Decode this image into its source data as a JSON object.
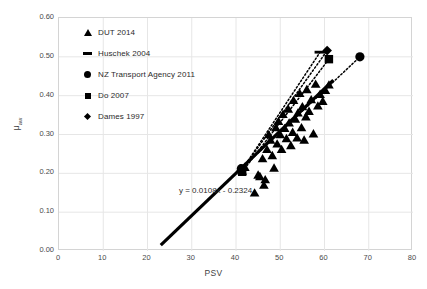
{
  "chart_data": {
    "type": "scatter",
    "title": "",
    "xlabel": "PSV",
    "ylabel": "μ",
    "ylabel_sub": "aw",
    "xlim": [
      0,
      80
    ],
    "ylim": [
      0.0,
      0.6
    ],
    "xticks": [
      0,
      10,
      20,
      30,
      40,
      50,
      60,
      70,
      80
    ],
    "yticks": [
      "0.00",
      "0.10",
      "0.20",
      "0.30",
      "0.40",
      "0.50",
      "0.60"
    ],
    "grid": true,
    "legend_position": "upper-left-inside",
    "annotations": [
      {
        "text": "y = 0.0108x - 0.2324",
        "x": 30,
        "y": 0.205
      }
    ],
    "legend": [
      {
        "label": "DUT 2014",
        "marker": "triangle-marker"
      },
      {
        "label": "Huschek 2004",
        "marker": "dash-marker"
      },
      {
        "label": "NZ Transport Agency 2011",
        "marker": "circle-marker"
      },
      {
        "label": "Do 2007",
        "marker": "square-marker"
      },
      {
        "label": "Dames 1997",
        "marker": "diamond-marker"
      }
    ],
    "series": [
      {
        "name": "DUT 2014",
        "marker": "triangle",
        "points": [
          [
            41.0,
            0.212
          ],
          [
            41.4,
            0.206
          ],
          [
            42.0,
            0.216
          ],
          [
            44.2,
            0.15
          ],
          [
            45.0,
            0.196
          ],
          [
            45.4,
            0.192
          ],
          [
            46.0,
            0.238
          ],
          [
            46.3,
            0.17
          ],
          [
            46.6,
            0.184
          ],
          [
            47.0,
            0.262
          ],
          [
            47.4,
            0.3
          ],
          [
            47.8,
            0.286
          ],
          [
            48.2,
            0.246
          ],
          [
            48.6,
            0.214
          ],
          [
            49.0,
            0.318
          ],
          [
            49.3,
            0.276
          ],
          [
            49.6,
            0.334
          ],
          [
            50.0,
            0.3
          ],
          [
            50.3,
            0.262
          ],
          [
            50.6,
            0.352
          ],
          [
            51.0,
            0.316
          ],
          [
            51.4,
            0.29
          ],
          [
            51.8,
            0.366
          ],
          [
            52.0,
            0.33
          ],
          [
            52.4,
            0.272
          ],
          [
            52.8,
            0.306
          ],
          [
            53.0,
            0.388
          ],
          [
            53.4,
            0.34
          ],
          [
            53.8,
            0.292
          ],
          [
            54.0,
            0.356
          ],
          [
            54.4,
            0.406
          ],
          [
            54.8,
            0.318
          ],
          [
            55.0,
            0.372
          ],
          [
            55.4,
            0.286
          ],
          [
            55.8,
            0.346
          ],
          [
            56.0,
            0.416
          ],
          [
            56.5,
            0.36
          ],
          [
            57.0,
            0.39
          ],
          [
            57.5,
            0.302
          ],
          [
            58.0,
            0.43
          ],
          [
            58.5,
            0.374
          ],
          [
            59.0,
            0.404
          ],
          [
            59.6,
            0.386
          ],
          [
            60.2,
            0.414
          ],
          [
            61.0,
            0.428
          ]
        ]
      },
      {
        "name": "Huschek 2004",
        "marker": "dash",
        "points": [
          [
            59.0,
            0.512
          ]
        ]
      },
      {
        "name": "NZ Transport Agency 2011",
        "marker": "circle",
        "points": [
          [
            41.2,
            0.212
          ],
          [
            68.0,
            0.5
          ]
        ]
      },
      {
        "name": "Do 2007",
        "marker": "square",
        "points": [
          [
            41.4,
            0.204
          ],
          [
            61.0,
            0.494
          ]
        ]
      },
      {
        "name": "Dames 1997",
        "marker": "diamond",
        "points": [
          [
            41.3,
            0.208
          ],
          [
            60.6,
            0.516
          ]
        ]
      }
    ],
    "trendlines": [
      {
        "name": "main-regression",
        "style": "solid",
        "x0": 23.0,
        "y0": 0.015,
        "x1": 62.0,
        "y1": 0.44
      },
      {
        "name": "huschek-trend",
        "style": "dotted",
        "x0": 41.3,
        "y0": 0.208,
        "x1": 59.0,
        "y1": 0.512
      },
      {
        "name": "dames-trend",
        "style": "dotted",
        "x0": 41.3,
        "y0": 0.208,
        "x1": 60.6,
        "y1": 0.516
      },
      {
        "name": "do-trend",
        "style": "dotted",
        "x0": 41.4,
        "y0": 0.204,
        "x1": 61.0,
        "y1": 0.494
      },
      {
        "name": "nz-trend",
        "style": "dotted",
        "x0": 41.2,
        "y0": 0.212,
        "x1": 68.0,
        "y1": 0.5
      }
    ]
  }
}
